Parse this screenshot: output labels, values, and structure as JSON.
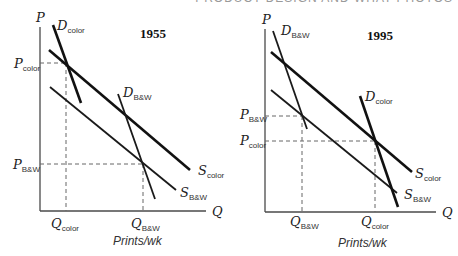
{
  "header": {
    "text": "PRODUCT DESIGN AND WHAT PHOTOS"
  },
  "panels": [
    {
      "id": "left",
      "year": "1955",
      "axis": {
        "y_label": "P",
        "x_label": "Q",
        "x_title": "Prints/wk"
      },
      "curves": [
        {
          "key": "D_color",
          "letter": "D",
          "sub": "color",
          "kind": "demand"
        },
        {
          "key": "D_bw",
          "letter": "D",
          "sub": "B&W",
          "kind": "demand"
        },
        {
          "key": "S_color",
          "letter": "S",
          "sub": "color",
          "kind": "supply"
        },
        {
          "key": "S_bw",
          "letter": "S",
          "sub": "B&W",
          "kind": "supply"
        }
      ],
      "price_labels": [
        {
          "letter": "P",
          "sub": "color"
        },
        {
          "letter": "P",
          "sub": "B&W"
        }
      ],
      "quantity_labels": [
        {
          "letter": "Q",
          "sub": "color"
        },
        {
          "letter": "Q",
          "sub": "B&W"
        }
      ],
      "equilibria": [
        {
          "market": "color",
          "relation": "P_color > P_B&W, Q_color < Q_B&W"
        }
      ]
    },
    {
      "id": "right",
      "year": "1995",
      "axis": {
        "y_label": "P",
        "x_label": "Q",
        "x_title": "Prints/wk"
      },
      "curves": [
        {
          "key": "D_bw",
          "letter": "D",
          "sub": "B&W",
          "kind": "demand"
        },
        {
          "key": "D_color",
          "letter": "D",
          "sub": "color",
          "kind": "demand"
        },
        {
          "key": "S_color",
          "letter": "S",
          "sub": "color",
          "kind": "supply"
        },
        {
          "key": "S_bw",
          "letter": "S",
          "sub": "B&W",
          "kind": "supply"
        }
      ],
      "price_labels": [
        {
          "letter": "P",
          "sub": "B&W"
        },
        {
          "letter": "P",
          "sub": "color"
        }
      ],
      "quantity_labels": [
        {
          "letter": "Q",
          "sub": "B&W"
        },
        {
          "letter": "Q",
          "sub": "color"
        }
      ],
      "equilibria": [
        {
          "market": "color",
          "relation": "P_B&W > P_color, Q_B&W < Q_color"
        }
      ]
    }
  ]
}
